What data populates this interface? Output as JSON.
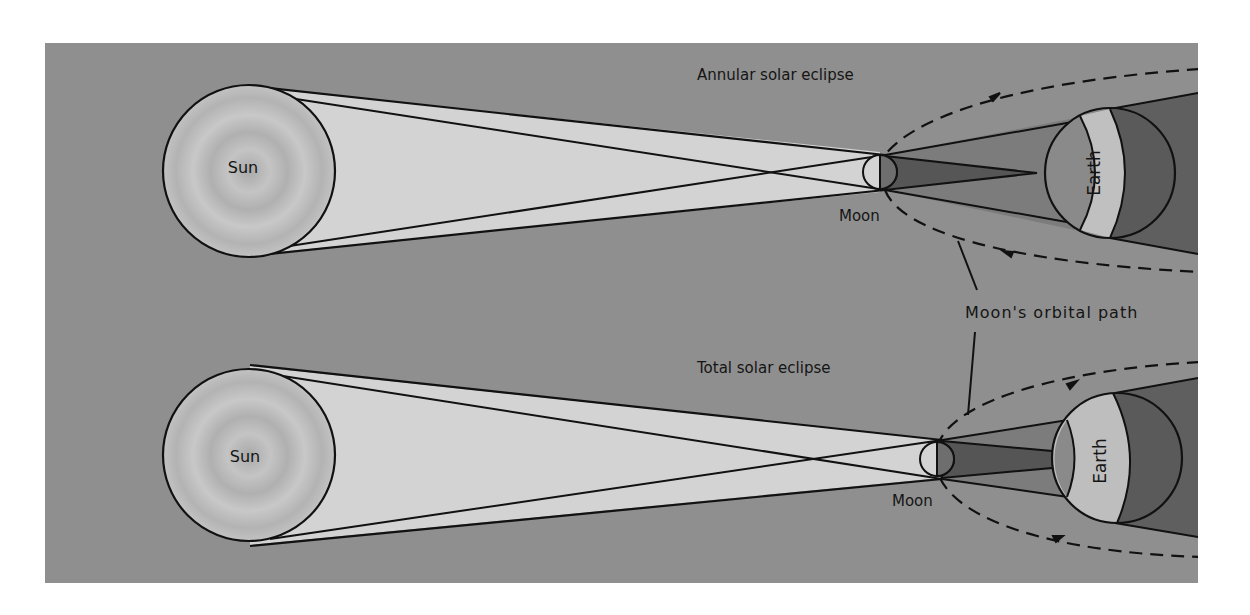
{
  "colors": {
    "page_bg": "#ffffff",
    "panel_bg": "#8f8f8f",
    "sun_fill": "#b4b4b4",
    "sun_ring": "#c6c6c6",
    "light_cone": "#d2d2d2",
    "moon_lit": "#d0d0d0",
    "moon_dark": "#6c6c6c",
    "penumbra": "#7b7b7b",
    "umbra": "#555555",
    "earth_lit_band": "#bdbdbd",
    "earth_night": "#5a5a5a",
    "earth_penumbra_side": "#8a8a8a",
    "earth_shadow_tail": "#5e5e5e",
    "stroke": "#111111"
  },
  "panels": [
    {
      "id": "annular",
      "title": "Annular solar eclipse",
      "sun_label": "Sun",
      "moon_label": "Moon",
      "earth_label": "Earth"
    },
    {
      "id": "total",
      "title": "Total solar eclipse",
      "sun_label": "Sun",
      "moon_label": "Moon",
      "earth_label": "Earth"
    }
  ],
  "shared_label": "Moon's orbital path"
}
